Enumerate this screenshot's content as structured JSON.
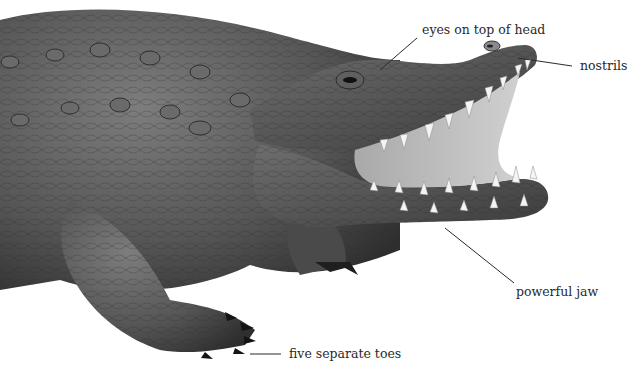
{
  "diagram": {
    "labels": {
      "eyes": "eyes on top of head",
      "nostrils": "nostrils",
      "jaw": "powerful jaw",
      "toes": "five separate toes"
    }
  }
}
